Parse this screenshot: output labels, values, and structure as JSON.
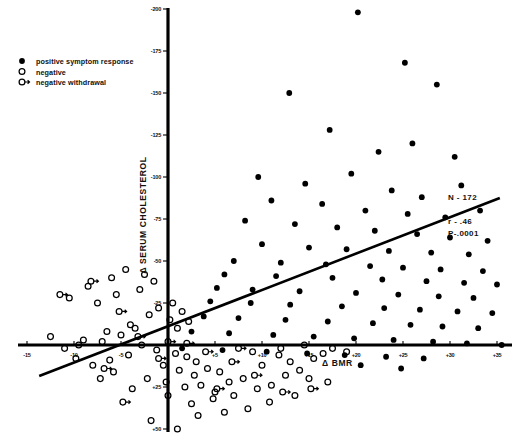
{
  "chart_data": {
    "type": "scatter",
    "title": "",
    "xlabel": "Δ BMR",
    "ylabel": "Δ SERUM CHOLESTEROL",
    "xlim": [
      -17,
      37.5
    ],
    "ylim": [
      55,
      -205
    ],
    "grid": false,
    "x_ticks": [
      -15,
      -10,
      -5,
      5,
      10,
      15,
      20,
      25,
      30,
      35
    ],
    "x_tick_labels": [
      "-15",
      "-10",
      "-5",
      "+5",
      "+10",
      "+15",
      "+20",
      "+25",
      "+30",
      "+35"
    ],
    "y_ticks": [
      -200,
      -175,
      -150,
      -125,
      -100,
      -75,
      -50,
      -25,
      25,
      50
    ],
    "y_tick_labels": [
      "-200",
      "-175",
      "-150",
      "-125",
      "-100",
      "-75",
      "-50",
      "-25",
      "+25",
      "+50"
    ],
    "legend_position": "top-left",
    "annotations": [
      "N - 172",
      "r - .46",
      "P-.0001"
    ],
    "statistics": {
      "n": "N - 172",
      "r": "r - .46",
      "p": "P-.0001"
    },
    "regression_line": {
      "x_start": -13.7,
      "y_start": 18.5,
      "x_end": 35.3,
      "y_end": -87.5
    },
    "series": [
      {
        "name": "positive symptom response",
        "marker": "filled-circle",
        "color": "#000000",
        "points": [
          [
            20.2,
            -198
          ],
          [
            25.2,
            -168
          ],
          [
            12.9,
            -150
          ],
          [
            28.6,
            -155
          ],
          [
            17.2,
            -128
          ],
          [
            26.0,
            -120
          ],
          [
            22.4,
            -115
          ],
          [
            30.5,
            -112
          ],
          [
            9.6,
            -100
          ],
          [
            14.6,
            -96
          ],
          [
            19.5,
            -102
          ],
          [
            23.8,
            -92
          ],
          [
            31.2,
            -95
          ],
          [
            27.0,
            -88
          ],
          [
            11.0,
            -86
          ],
          [
            16.4,
            -84
          ],
          [
            21.0,
            -80
          ],
          [
            25.5,
            -78
          ],
          [
            29.5,
            -76
          ],
          [
            33.2,
            -80
          ],
          [
            8.2,
            -74
          ],
          [
            13.5,
            -72
          ],
          [
            18.0,
            -70
          ],
          [
            22.0,
            -68
          ],
          [
            26.5,
            -66
          ],
          [
            30.0,
            -64
          ],
          [
            34.0,
            -62
          ],
          [
            10.0,
            -60
          ],
          [
            15.0,
            -58
          ],
          [
            19.0,
            -57
          ],
          [
            23.5,
            -56
          ],
          [
            28.0,
            -55
          ],
          [
            32.0,
            -54
          ],
          [
            7.0,
            -50
          ],
          [
            12.0,
            -49
          ],
          [
            16.8,
            -48
          ],
          [
            21.5,
            -47
          ],
          [
            25.0,
            -46
          ],
          [
            29.0,
            -45
          ],
          [
            33.5,
            -44
          ],
          [
            6.0,
            -42
          ],
          [
            11.5,
            -41
          ],
          [
            17.5,
            -40
          ],
          [
            22.8,
            -39
          ],
          [
            27.5,
            -38
          ],
          [
            31.5,
            -37
          ],
          [
            35.0,
            -36
          ],
          [
            5.2,
            -34
          ],
          [
            9.0,
            -33
          ],
          [
            14.0,
            -32
          ],
          [
            20.0,
            -31
          ],
          [
            24.5,
            -30
          ],
          [
            28.8,
            -29
          ],
          [
            32.5,
            -28
          ],
          [
            4.5,
            -26
          ],
          [
            8.8,
            -25
          ],
          [
            13.0,
            -24
          ],
          [
            18.5,
            -23
          ],
          [
            23.0,
            -22
          ],
          [
            26.8,
            -21
          ],
          [
            30.8,
            -20
          ],
          [
            34.5,
            -19
          ],
          [
            3.8,
            -17
          ],
          [
            7.5,
            -16
          ],
          [
            12.5,
            -15
          ],
          [
            17.0,
            -14
          ],
          [
            21.8,
            -13
          ],
          [
            25.8,
            -12
          ],
          [
            29.2,
            -11
          ],
          [
            33.0,
            -10
          ],
          [
            2.5,
            -8
          ],
          [
            6.5,
            -7
          ],
          [
            11.2,
            -6
          ],
          [
            15.5,
            -5
          ],
          [
            19.8,
            -4
          ],
          [
            24.0,
            -3
          ],
          [
            28.2,
            -2
          ],
          [
            31.8,
            -1
          ],
          [
            35.5,
            0
          ],
          [
            1.5,
            2
          ],
          [
            5.8,
            3
          ],
          [
            10.5,
            4
          ],
          [
            14.8,
            5
          ],
          [
            18.8,
            6
          ],
          [
            23.2,
            7
          ],
          [
            27.2,
            8
          ],
          [
            20.5,
            12
          ],
          [
            24.8,
            14
          ]
        ]
      },
      {
        "name": "negative",
        "marker": "open-circle",
        "color": "#000000",
        "points": [
          [
            -12.5,
            -5
          ],
          [
            -9.0,
            -3
          ],
          [
            -6.5,
            -8
          ],
          [
            -4.0,
            -12
          ],
          [
            -2.0,
            -18
          ],
          [
            -1.0,
            -22
          ],
          [
            0.5,
            -25
          ],
          [
            1.5,
            -20
          ],
          [
            -7.5,
            -25
          ],
          [
            -5.5,
            -30
          ],
          [
            -3.0,
            -33
          ],
          [
            -8.5,
            -35
          ],
          [
            -10.5,
            -28
          ],
          [
            -6.0,
            -40
          ],
          [
            -4.5,
            -45
          ],
          [
            -2.5,
            -42
          ],
          [
            -1.5,
            -38
          ],
          [
            0.2,
            -15
          ],
          [
            1.0,
            -10
          ],
          [
            2.2,
            -14
          ],
          [
            -3.5,
            -10
          ],
          [
            -5.0,
            -6
          ],
          [
            -7.0,
            -2
          ],
          [
            -9.5,
            0
          ],
          [
            -11.0,
            2
          ],
          [
            -2.8,
            0
          ],
          [
            -1.2,
            3
          ],
          [
            0.8,
            5
          ],
          [
            2.0,
            7
          ],
          [
            3.0,
            10
          ],
          [
            -4.2,
            6
          ],
          [
            -6.2,
            9
          ],
          [
            -8.0,
            12
          ],
          [
            -0.5,
            12
          ],
          [
            1.2,
            15
          ],
          [
            2.8,
            18
          ],
          [
            4.2,
            14
          ],
          [
            5.5,
            16
          ],
          [
            -2.2,
            20
          ],
          [
            -0.2,
            22
          ],
          [
            1.8,
            25
          ],
          [
            3.5,
            24
          ],
          [
            5.0,
            28
          ],
          [
            6.5,
            22
          ],
          [
            8.0,
            20
          ],
          [
            0.0,
            30
          ],
          [
            2.5,
            35
          ],
          [
            4.8,
            32
          ],
          [
            7.0,
            30
          ],
          [
            9.5,
            26
          ],
          [
            11.0,
            24
          ],
          [
            3.2,
            42
          ],
          [
            6.0,
            40
          ],
          [
            8.5,
            38
          ],
          [
            12.5,
            18
          ],
          [
            14.0,
            15
          ],
          [
            10.0,
            12
          ],
          [
            13.0,
            10
          ],
          [
            15.5,
            8
          ],
          [
            11.8,
            6
          ],
          [
            9.0,
            4
          ],
          [
            12.0,
            2
          ],
          [
            16.5,
            5
          ],
          [
            14.5,
            0
          ],
          [
            -1.8,
            45
          ],
          [
            1.0,
            50
          ],
          [
            10.8,
            34
          ],
          [
            13.5,
            30
          ],
          [
            -5.8,
            16
          ],
          [
            -7.2,
            20
          ],
          [
            -3.8,
            26
          ],
          [
            -9.8,
            8
          ],
          [
            17.5,
            2
          ],
          [
            19.0,
            4
          ],
          [
            15.0,
            20
          ],
          [
            17.0,
            22
          ]
        ]
      },
      {
        "name": "negative withdrawal",
        "marker": "open-circle-tail",
        "color": "#000000",
        "points": [
          [
            -11.5,
            -30
          ],
          [
            -8.2,
            -38
          ],
          [
            -5.2,
            -20
          ],
          [
            -3.2,
            -5
          ],
          [
            0.0,
            -2
          ],
          [
            2.0,
            -1
          ],
          [
            -6.8,
            14
          ],
          [
            -1.0,
            8
          ],
          [
            4.0,
            4
          ],
          [
            6.8,
            10
          ],
          [
            9.2,
            18
          ],
          [
            5.2,
            26
          ],
          [
            12.2,
            28
          ],
          [
            -4.8,
            34
          ],
          [
            7.5,
            2
          ],
          [
            15.2,
            26
          ]
        ]
      }
    ]
  },
  "legend": {
    "items": [
      {
        "label": "positive symptom response",
        "marker": "filled-circle"
      },
      {
        "label": "negative",
        "marker": "open-circle"
      },
      {
        "label": "negative  withdrawal",
        "marker": "open-circle-tail"
      }
    ]
  }
}
